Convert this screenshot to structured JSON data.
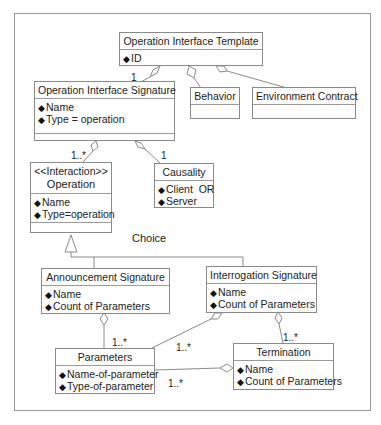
{
  "diagram": {
    "classes": {
      "template": {
        "name": "Operation Interface Template",
        "attrs": [
          "ID"
        ]
      },
      "signature": {
        "name": "Operation Interface Signature",
        "attrs": [
          "Name",
          "Type = operation"
        ]
      },
      "behavior": {
        "name": "Behavior"
      },
      "environment": {
        "name": "Environment Contract"
      },
      "operation": {
        "stereotype": "<<Interaction>>",
        "name": "Operation",
        "attrs": [
          "Name",
          "Type=operation"
        ]
      },
      "causality": {
        "name": "Causality",
        "attrs": [
          "Client  OR",
          "Server"
        ]
      },
      "announcement": {
        "name": "Announcement Signature",
        "attrs": [
          "Name",
          "Count of Parameters"
        ]
      },
      "interrogation": {
        "name": "Interrogation Signature",
        "attrs": [
          "Name",
          "Count of Parameters"
        ]
      },
      "parameters": {
        "name": "Parameters",
        "attrs": [
          "Name-of-parameter",
          "Type-of-parameter"
        ]
      },
      "termination": {
        "name": "Termination",
        "attrs": [
          "Name",
          "Count of Parameters"
        ]
      }
    },
    "labels": {
      "template_signature_mult": "1",
      "signature_operation_mult": "1..*",
      "signature_causality_mult": "1",
      "choice": "Choice",
      "announcement_parameters_mult": "1..*",
      "interrogation_parameters_mult": "1..*",
      "termination_parameters_mult": "1..*",
      "interrogation_termination_mult": "1..*"
    },
    "colors": {
      "line": "#8a8a8a",
      "border": "#8a8a8a",
      "text": "#222222"
    }
  }
}
